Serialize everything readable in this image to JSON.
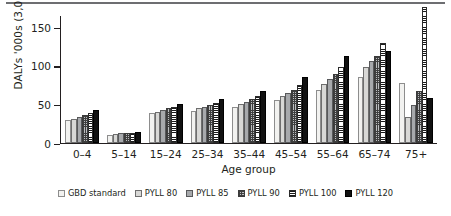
{
  "chart_data": {
    "type": "bar",
    "title": "",
    "xlabel": "Age group",
    "ylabel": "DALYs '000s (3,0)",
    "categories": [
      "0–4",
      "5–14",
      "15–24",
      "25–34",
      "35–44",
      "45–54",
      "55–64",
      "65–74",
      "75+"
    ],
    "yticks": [
      0,
      50,
      100,
      150
    ],
    "ylim": [
      0,
      165
    ],
    "grid": false,
    "legend_position": "bottom",
    "series": [
      {
        "name": "GBD standard",
        "swatch": "light-open",
        "color": "#f2f2f0",
        "values": [
          29,
          10,
          38,
          41,
          46,
          55,
          68,
          84,
          77
        ]
      },
      {
        "name": "PYLL 80",
        "swatch": "light-gray",
        "color": "#d8d8d6",
        "values": [
          31,
          11,
          40,
          44,
          50,
          60,
          76,
          97,
          33
        ]
      },
      {
        "name": "PYLL 85",
        "swatch": "medium-gray",
        "color": "#a7a9ac",
        "values": [
          33,
          12,
          42,
          46,
          53,
          64,
          82,
          105,
          48
        ]
      },
      {
        "name": "PYLL 90",
        "swatch": "checkered",
        "color": "#bcbec0",
        "values": [
          35,
          12,
          44,
          48,
          56,
          68,
          88,
          112,
          66
        ]
      },
      {
        "name": "PYLL 100",
        "swatch": "horizontal-stripes",
        "color": "#ffffff",
        "values": [
          38,
          13,
          46,
          51,
          60,
          74,
          97,
          128,
          175
        ]
      },
      {
        "name": "PYLL 120",
        "swatch": "solid-black",
        "color": "#111111",
        "values": [
          42,
          14,
          50,
          56,
          67,
          84,
          112,
          118,
          57
        ]
      }
    ]
  },
  "axis": {
    "y_title": "DALYs '000s (3,0)",
    "x_title": "Age group",
    "y_tick_labels": [
      "150",
      "100",
      "50",
      "0"
    ],
    "x_tick_labels": [
      "0–4",
      "5–14",
      "15–24",
      "25–34",
      "35–44",
      "45–54",
      "55–64",
      "65–74",
      "75+"
    ]
  },
  "legend": {
    "items": [
      {
        "label": "GBD standard"
      },
      {
        "label": "PYLL 80"
      },
      {
        "label": "PYLL 85"
      },
      {
        "label": "PYLL 90"
      },
      {
        "label": "PYLL 100"
      },
      {
        "label": "PYLL 120"
      }
    ]
  }
}
